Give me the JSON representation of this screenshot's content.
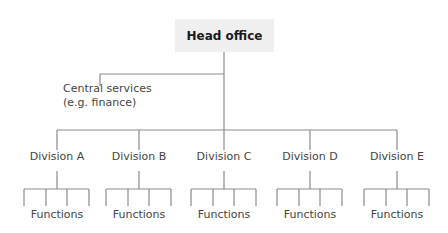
{
  "diagram": {
    "type": "organization-chart",
    "head": {
      "label": "Head office"
    },
    "central_services": {
      "line1": "Central services",
      "line2": "(e.g. finance)"
    },
    "divisions": [
      {
        "label": "Division A",
        "sub_label": "Functions",
        "center_x": 57
      },
      {
        "label": "Division B",
        "sub_label": "Functions",
        "center_x": 139
      },
      {
        "label": "Division C",
        "sub_label": "Functions",
        "center_x": 224
      },
      {
        "label": "Division D",
        "sub_label": "Functions",
        "center_x": 310
      },
      {
        "label": "Division E",
        "sub_label": "Functions",
        "center_x": 397
      }
    ],
    "functions_per_division": 4,
    "colors": {
      "line": "#8a8a8a",
      "head_box_fill": "#efefef",
      "text": "#444444"
    }
  }
}
